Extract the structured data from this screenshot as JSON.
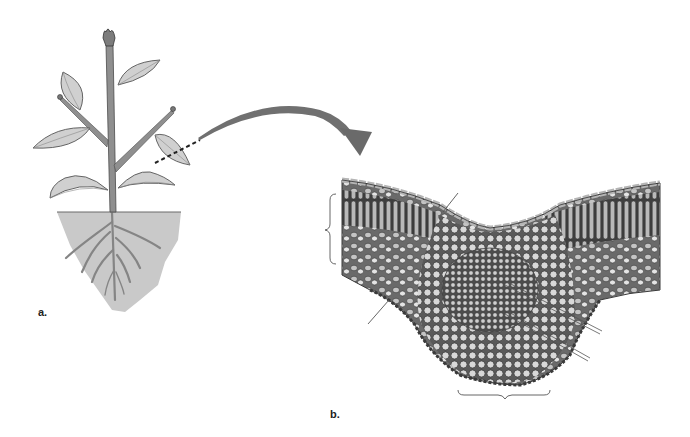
{
  "figure": {
    "panels": [
      {
        "id": "a",
        "label": "a.",
        "content": "Whole plant illustration above and below soil line; dashed line marks cut through a leaf"
      },
      {
        "id": "b",
        "label": "b.",
        "content": "Cross-section of leaf through the midrib showing epidermis, palisade and spongy mesophyll, and vascular bundle"
      }
    ],
    "arrow": {
      "from": "a",
      "to": "b",
      "style": "curved",
      "color": "#6b6b6b"
    },
    "callouts": {
      "left_bracket": {
        "text": "",
        "spans": "mesophyll layers (blank label)"
      },
      "bottom_bracket": {
        "text": "",
        "spans": "midrib / vascular bundle (blank label)"
      },
      "leader_lines": [
        {
          "id": "upper-epidermis-line",
          "text": ""
        },
        {
          "id": "lower-left-line",
          "text": ""
        },
        {
          "id": "xylem-line",
          "text": ""
        },
        {
          "id": "phloem-line",
          "text": ""
        }
      ]
    },
    "colors": {
      "stem": "#8c8c8c",
      "leaf_fill": "#cfcfcf",
      "leaf_vein": "#7a7a7a",
      "soil": "#c8c8c8",
      "arrow": "#6d6d6d",
      "tissue_dark": "#4a4a4a",
      "tissue_light": "#d9d9d9"
    }
  }
}
